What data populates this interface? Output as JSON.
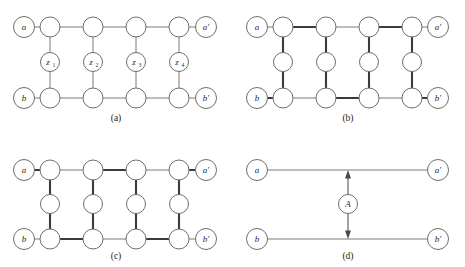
{
  "figure": {
    "background_color": "#ffffff",
    "thin_edge_color": "#7a7a78",
    "bold_edge_color": "#3b3b3a",
    "node_stroke_color": "#6e6e6c",
    "node_fill_color": "#ffffff"
  },
  "panels": [
    {
      "id": "a",
      "caption": "(a)",
      "terminals": {
        "top_left": "a",
        "top_right": "a'",
        "bottom_left": "b",
        "bottom_right": "b'"
      },
      "middle_labels": [
        "z",
        "z",
        "z",
        "z"
      ],
      "middle_subscripts": [
        "1",
        "2",
        "3",
        "4"
      ],
      "column_count": 4,
      "bold_edges": []
    },
    {
      "id": "b",
      "caption": "(b)",
      "terminals": {
        "top_left": "a",
        "top_right": "a'",
        "bottom_left": "b",
        "bottom_right": "b'"
      },
      "middle_labels": [
        "",
        "",
        "",
        ""
      ],
      "middle_subscripts": [
        "",
        "",
        "",
        ""
      ],
      "column_count": 4,
      "bold_edges": [
        "top-1-2",
        "top-3-4",
        "bottom-2-3",
        "bottom-4-right",
        "left-b-1",
        "col1-vert",
        "col2-vert",
        "col3-vert",
        "col4-vert"
      ]
    },
    {
      "id": "c",
      "caption": "(c)",
      "terminals": {
        "top_left": "a",
        "top_right": "a'",
        "bottom_left": "b",
        "bottom_right": "b'"
      },
      "middle_labels": [
        "",
        "",
        "",
        ""
      ],
      "middle_subscripts": [
        "",
        "",
        "",
        ""
      ],
      "column_count": 4,
      "bold_edges": [
        "left-a-1",
        "top-2-3",
        "top-4-right",
        "bottom-1-2",
        "bottom-3-4",
        "col1-vert",
        "col2-vert",
        "col3-vert",
        "col4-vert"
      ]
    },
    {
      "id": "d",
      "caption": "(d)",
      "terminals": {
        "top_left": "a",
        "top_right": "a'",
        "bottom_left": "b",
        "bottom_right": "b'"
      },
      "center_label": "A",
      "arrow": {
        "double_headed": true,
        "orientation": "vertical"
      }
    }
  ]
}
